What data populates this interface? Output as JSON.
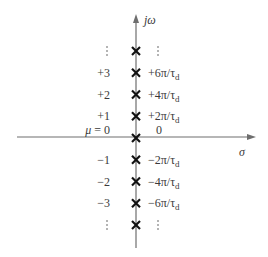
{
  "diagram": {
    "type": "pole-plot",
    "axes": {
      "vertical_label_j": "j",
      "vertical_label_omega": "ω",
      "horizontal_label": "σ"
    },
    "columns": {
      "left_header": "μ",
      "right_header": "pole location"
    },
    "rows": [
      {
        "mu": "⋮",
        "location": "⋮",
        "ellipsis": true,
        "marker": "x"
      },
      {
        "mu": "+3",
        "loc_prefix": "+6π/τ",
        "loc_sub": "d",
        "marker": "x"
      },
      {
        "mu": "+2",
        "loc_prefix": "+4π/τ",
        "loc_sub": "d",
        "marker": "x"
      },
      {
        "mu": "+1",
        "loc_prefix": "+2π/τ",
        "loc_sub": "d",
        "marker": "x"
      },
      {
        "mu": "μ = 0",
        "location": "0",
        "marker": "x",
        "origin": true
      },
      {
        "mu": "−1",
        "loc_prefix": "−2π/τ",
        "loc_sub": "d",
        "marker": "x"
      },
      {
        "mu": "−2",
        "loc_prefix": "−4π/τ",
        "loc_sub": "d",
        "marker": "x"
      },
      {
        "mu": "−3",
        "loc_prefix": "−6π/τ",
        "loc_sub": "d",
        "marker": "x"
      },
      {
        "mu": "⋮",
        "location": "⋮",
        "ellipsis": true,
        "marker": "x"
      }
    ],
    "colors": {
      "axis": "#6e6e6e",
      "marker": "#111111",
      "text": "#3a3a3a"
    }
  }
}
